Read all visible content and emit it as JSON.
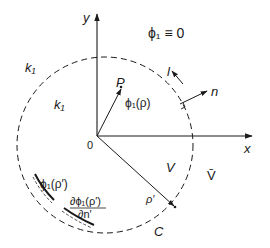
{
  "diagram": {
    "axes": {
      "x_label": "x",
      "y_label": "y",
      "origin_label": "0"
    },
    "boundary_condition": "ϕ₁ ≡ 0",
    "regions": {
      "outer_k": "k₁",
      "inner_k": "k₁",
      "interior": "V",
      "exterior": "V̄"
    },
    "contour_label": "C",
    "point_label": "P",
    "field_at_point": "ϕ₁(ρ)",
    "tangent_label": "l",
    "normal_label": "n",
    "boundary_vector_label": "ρ′",
    "boundary_value_label": "ϕ₁(ρ′)",
    "normal_derivative": {
      "numerator": "∂ϕ₁(ρ′)",
      "denominator": "∂n′"
    },
    "colors": {
      "ink": "#1a1a1a",
      "background": "#ffffff"
    }
  }
}
